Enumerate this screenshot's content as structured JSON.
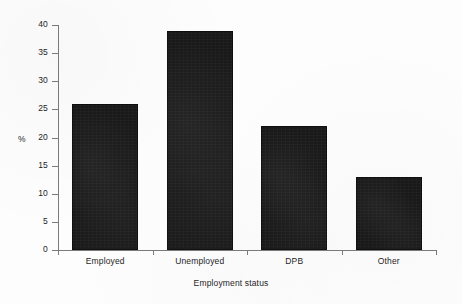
{
  "chart_data": {
    "type": "bar",
    "title": "",
    "subtitle": "",
    "categories": [
      "Employed",
      "Unemployed",
      "DPB",
      "Other"
    ],
    "values": [
      26,
      39,
      22,
      13
    ],
    "xlabel": "Employment status",
    "ylabel": "%",
    "ylim": [
      0,
      40
    ],
    "ytick_values": [
      0,
      5,
      10,
      15,
      20,
      25,
      30,
      35,
      40
    ],
    "ytick_labels": [
      "0",
      "5",
      "10",
      "15",
      "20",
      "25",
      "30",
      "35",
      "40"
    ],
    "ytick_interval": 5,
    "grid": false,
    "legend": false,
    "legend_position": "none",
    "annotations": [],
    "bar_color": "#191919",
    "axis_color": "#7b7b7b",
    "text_color": "#1d1d1d",
    "background_color": "#fdfdfd"
  }
}
